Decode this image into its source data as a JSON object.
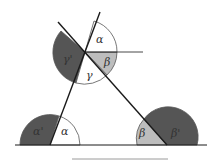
{
  "diagram": {
    "colors": {
      "line": "#1a1a1a",
      "dark_fill": "#555555",
      "light_fill": "#bdbdbd",
      "white_fill": "#ffffff",
      "arc_stroke": "#555555",
      "bottom_rule": "#9a9a9a"
    },
    "vertices": {
      "A": {
        "x": 50,
        "y": 145
      },
      "B": {
        "x": 167,
        "y": 145
      },
      "C": {
        "x": 85,
        "y": 52
      }
    },
    "labels": {
      "top_alpha": "α",
      "top_beta": "β",
      "top_gamma": "γ",
      "top_gamma_prime": "γ'",
      "left_alpha": "α",
      "left_alpha_prime": "α'",
      "right_beta": "β",
      "right_beta_prime": "β'"
    }
  }
}
